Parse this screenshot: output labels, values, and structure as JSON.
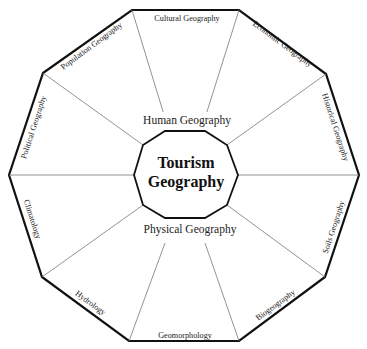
{
  "diagram": {
    "title_line1": "Tourism",
    "title_line2": "Geography",
    "human": "Human Geography",
    "physical": "Physical Geography",
    "segments": {
      "cultural": "Cultural Geography",
      "economic": "Economic Geography",
      "historical": "Historical Geography",
      "soils": "Soils Geography",
      "biogeography": "Biogeography",
      "geomorphology": "Geomorphology",
      "hydrology": "Hydrology",
      "climatology": "Climatology",
      "political": "Political Geography",
      "population": "Population Geography"
    },
    "colors": {
      "outline": "#111111",
      "spokes": "#777777",
      "text": "#222222",
      "background": "#ffffff"
    }
  }
}
